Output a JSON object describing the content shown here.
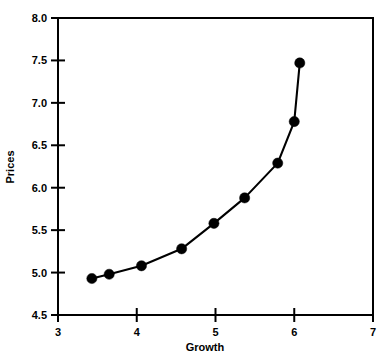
{
  "chart_data": {
    "type": "line",
    "title": "",
    "subtitle": "",
    "xlabel": "Growth",
    "ylabel": "Prices",
    "xlim": [
      3,
      7
    ],
    "ylim": [
      4.5,
      8.0
    ],
    "xticks": [
      3,
      4,
      5,
      6,
      7
    ],
    "xtick_labels": [
      "3",
      "4",
      "5",
      "6",
      "7"
    ],
    "yticks": [
      4.5,
      5.0,
      5.5,
      6.0,
      6.5,
      7.0,
      7.5,
      8.0
    ],
    "ytick_labels": [
      "4.5",
      "5.0",
      "5.5",
      "6.0",
      "6.5",
      "7.0",
      "7.5",
      "8.0"
    ],
    "grid": false,
    "legend": null,
    "legend_position": "none",
    "marker": "filled-circle",
    "marker_color": "#000000",
    "line_color": "#000000",
    "series": [
      {
        "name": "Prices",
        "x": [
          3.43,
          3.65,
          4.06,
          4.57,
          4.98,
          5.37,
          5.79,
          6.0,
          6.07
        ],
        "y": [
          4.93,
          4.98,
          5.08,
          5.28,
          5.58,
          5.88,
          6.29,
          6.78,
          7.47
        ]
      }
    ],
    "annotations": []
  },
  "figure": {
    "background_color": "#FFFFFF",
    "foreground_color": "#000000"
  }
}
